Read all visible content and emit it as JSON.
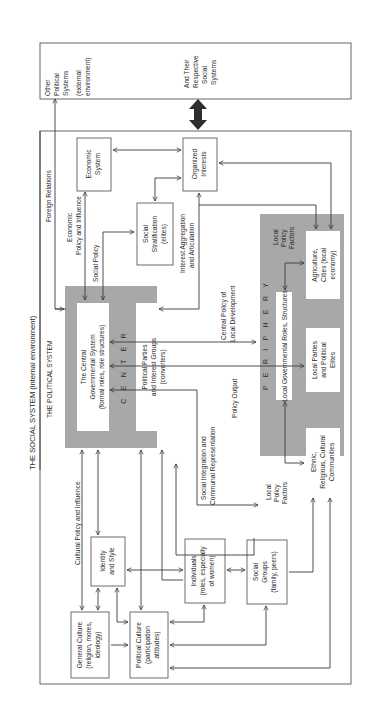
{
  "diagram": {
    "titles": {
      "social_system": "THE SOCIAL SYSTEM (internal environment)",
      "political_system": "THE POLITICAL SYSTEM"
    },
    "external": {
      "other_systems": [
        "Other",
        "Political",
        "Systems",
        "(external",
        "environment)"
      ],
      "respective": [
        "And Their",
        "Respective",
        "Social",
        "Systems"
      ]
    },
    "zones": {
      "center": "C E N T E R",
      "periphery": "P E R I P H E R Y"
    },
    "boxes": {
      "central_gov": [
        "The Central",
        "Governmental System",
        "(formal roles, role structures)"
      ],
      "parties": [
        "Political Parties",
        "and Interest Groups",
        "(converters)"
      ],
      "economic": [
        "Economic",
        "System"
      ],
      "organized": [
        "Organized",
        "Interests"
      ],
      "stratification": [
        "Social",
        "Stratification",
        "(elites)"
      ],
      "local_gov": [
        "Local Governmental Roles, Structures"
      ],
      "agriculture": [
        "Agriculture,",
        "Cities (local",
        "economy)"
      ],
      "local_parties": [
        "Local Parties",
        "and Political",
        "Elites"
      ],
      "ethnic": [
        "Ethnic,",
        "Religious, Cultural",
        "Communities"
      ],
      "identity": [
        "Identity",
        "and Style"
      ],
      "individuals": [
        "Individuals",
        "(roles, especially",
        "of women)"
      ],
      "social_groups": [
        "Social",
        "Groups",
        "(family, peers)"
      ],
      "general_culture": [
        "General Culture",
        "(religion, mores,",
        "ideology)"
      ],
      "political_culture": [
        "Political Culture",
        "(participation",
        "attitudes)"
      ]
    },
    "labels": {
      "foreign_relations": "Foreign Relations",
      "economic_policy": [
        "Economic",
        "Policy and Influence"
      ],
      "social_policy": "Social Policy",
      "interest_aggregation": [
        "Interest Aggregation",
        "and Articulation"
      ],
      "central_policy": [
        "Central Policy of",
        "Local Development"
      ],
      "policy_output": "Policy Output",
      "social_integration": [
        "Social Integration and",
        "Communal Representation"
      ],
      "cultural_policy": "Cultural Policy and Influence",
      "local_policy_factors_top": [
        "Local",
        "Policy",
        "Factors"
      ],
      "local_policy_factors_bottom": [
        "Local",
        "Policy",
        "Factors"
      ]
    }
  }
}
